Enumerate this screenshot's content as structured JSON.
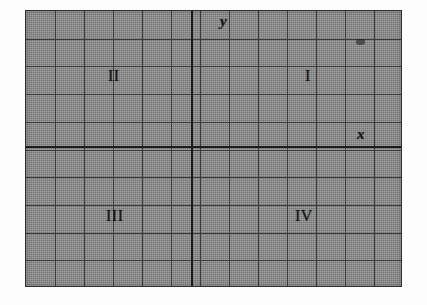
{
  "figure": {
    "kind": "cartesian-coordinate-plane",
    "background_color": "#8b8b8b",
    "grid_line_color": "#3b3b3b",
    "axis_line_color": "#1b1b1b",
    "page_color": "#fdfdfd"
  },
  "grid": {
    "columns": 13,
    "rows": 10,
    "cell_width_px": 29,
    "cell_height_px": 27.7,
    "left_px": 25,
    "top_px": 10,
    "width_px": 377,
    "height_px": 277
  },
  "axes": {
    "x_axis": {
      "label": "x",
      "orientation": "horizontal",
      "position_px": 145,
      "label_left_px": 357,
      "label_top_px": 127
    },
    "y_axis": {
      "label": "y",
      "orientation": "vertical",
      "position_px": 190,
      "label_left_px": 220,
      "label_top_px": 14
    }
  },
  "quadrants": [
    {
      "name": "quadrant-one",
      "label": "I",
      "left_px": 305,
      "top_px": 68
    },
    {
      "name": "quadrant-two",
      "label": "II",
      "left_px": 108,
      "top_px": 68
    },
    {
      "name": "quadrant-three",
      "label": "III",
      "left_px": 106,
      "top_px": 208
    },
    {
      "name": "quadrant-four",
      "label": "IV",
      "left_px": 295,
      "top_px": 208
    }
  ],
  "marks": {
    "smudge": {
      "name": "scan-smudge",
      "left_px": 355,
      "top_px": 38
    }
  }
}
